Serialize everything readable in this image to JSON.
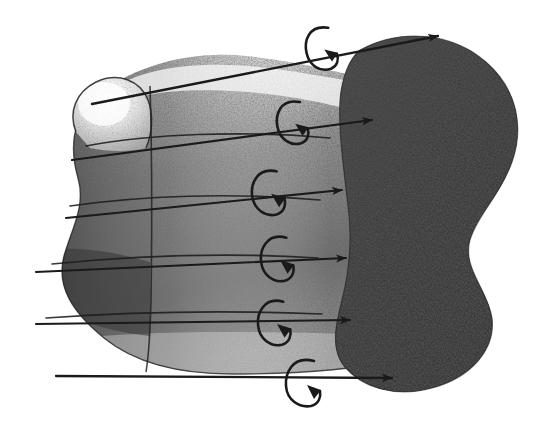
{
  "figure": {
    "title": "Stippled pen-and-ink diagram of a deformed tube mapping onto a blob",
    "background_color": "#ffffff",
    "ink_color": "#111111",
    "mid_tone_color": "#6d6d6d",
    "dark_tone_color": "#2b2b2b",
    "light_tone_color": "#d8d8d8",
    "canvas": {
      "width": 542,
      "height": 431
    },
    "style": "stipple / halftone engraving",
    "caption": ""
  },
  "shapes": {
    "tube_body": {
      "name": "deformed cylinder body",
      "fill_tone": "mid",
      "outline": "M 92 100 C 72 122 70 150 78 178 C 86 206 72 228 64 256 C 56 286 72 312 104 338 C 136 364 180 374 232 374 C 300 374 352 370 394 360 L 398 88 C 352 74 300 62 246 56 C 190 50 130 66 92 100 Z"
    },
    "tube_cap": {
      "name": "rounded tube end cap",
      "fill_tone": "light",
      "outline": "M 76 132 C 68 112 76 92 96 82 C 118 72 140 80 148 100 C 154 116 152 132 146 146 C 132 150 110 150 92 146 Z"
    },
    "tube_highlight": {
      "name": "specular highlight band along upper tube",
      "fill_tone": "highlight",
      "outline": "M 100 96 C 140 66 200 60 268 68 C 330 76 378 86 410 96 L 404 120 C 360 106 300 94 248 90 C 190 86 140 88 110 106 Z"
    },
    "blob": {
      "name": "target blob region",
      "fill_tone": "dark",
      "outline": "M 360 50 C 400 28 452 32 486 62 C 518 90 524 128 512 162 C 500 196 478 214 470 240 C 462 268 488 290 492 318 C 496 350 470 378 432 388 C 396 398 362 388 344 366 C 330 348 336 324 342 300 C 350 268 352 236 348 206 C 344 170 338 130 340 100 C 342 76 350 58 360 50 Z"
    },
    "fold_line_vertical": {
      "name": "vertical fold seam",
      "path": "M 150 86 C 152 150 152 230 151 300 C 150 340 148 360 146 372"
    }
  },
  "map_arrows": [
    {
      "id": "arrow-1",
      "label": "top mapping arrow",
      "start_x": 92,
      "start_y": 104,
      "end_x": 438,
      "end_y": 36,
      "has_head": true
    },
    {
      "id": "arrow-2",
      "label": "second mapping arrow",
      "start_x": 72,
      "start_y": 160,
      "end_x": 372,
      "end_y": 120,
      "has_head": true
    },
    {
      "id": "arrow-3",
      "label": "third mapping arrow",
      "start_x": 66,
      "start_y": 218,
      "end_x": 342,
      "end_y": 190,
      "has_head": true
    },
    {
      "id": "arrow-4",
      "label": "fourth mapping arrow",
      "start_x": 36,
      "start_y": 272,
      "end_x": 346,
      "end_y": 258,
      "has_head": true
    },
    {
      "id": "arrow-5",
      "label": "fifth mapping arrow",
      "start_x": 36,
      "start_y": 324,
      "end_x": 350,
      "end_y": 320,
      "has_head": true
    },
    {
      "id": "arrow-6",
      "label": "bottom mapping arrow",
      "start_x": 56,
      "start_y": 376,
      "end_x": 392,
      "end_y": 378,
      "has_head": true
    }
  ],
  "rotation_arrows": [
    {
      "id": "rot-1",
      "label": "top rotation loop",
      "cx": 321,
      "cy": 48,
      "rx": 15,
      "ry": 22,
      "tilt": -8
    },
    {
      "id": "rot-2",
      "label": "second rotation loop",
      "cx": 292,
      "cy": 122,
      "rx": 15,
      "ry": 22,
      "tilt": -6
    },
    {
      "id": "rot-3",
      "label": "third rotation loop",
      "cx": 268,
      "cy": 192,
      "rx": 15,
      "ry": 23,
      "tilt": -4
    },
    {
      "id": "rot-4",
      "label": "fourth rotation loop",
      "cx": 277,
      "cy": 258,
      "rx": 15,
      "ry": 23,
      "tilt": -2
    },
    {
      "id": "rot-5",
      "label": "fifth rotation loop",
      "cx": 274,
      "cy": 322,
      "rx": 15,
      "ry": 23,
      "tilt": -2
    },
    {
      "id": "rot-6",
      "label": "bottom rotation loop",
      "cx": 303,
      "cy": 382,
      "rx": 16,
      "ry": 24,
      "tilt": 0
    }
  ],
  "contour_lines": [
    {
      "id": "contour-1",
      "label": "tube contour 1",
      "path": "M 86 146 C 150 134 240 130 330 138"
    },
    {
      "id": "contour-2",
      "label": "tube contour 2",
      "path": "M 70 206 C 140 196 230 192 320 200"
    },
    {
      "id": "contour-3",
      "label": "tube contour 3",
      "path": "M 52 264 C 130 256 220 252 318 258"
    },
    {
      "id": "contour-4",
      "label": "tube contour 4",
      "path": "M 46 318 C 128 312 220 310 322 314"
    }
  ]
}
